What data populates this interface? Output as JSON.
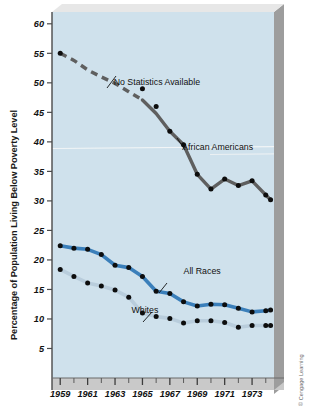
{
  "figure": {
    "credit": "© Cengage Learning",
    "background_color": "#ffffff",
    "plot_background_color": "#cfe1ec",
    "shadow_color": "#9a9a9a",
    "axis_band_color": "#c8c8c8"
  },
  "chart_data": {
    "type": "line",
    "title": "",
    "xlabel": "",
    "ylabel": "Percentage of Population Living Below Poverty Level",
    "xlim": [
      1958.4,
      1974.6
    ],
    "ylim": [
      0,
      62
    ],
    "grid": false,
    "legend_position": "inline-annotations",
    "ytick_labels": [
      "60",
      "55",
      "50",
      "45",
      "40",
      "35",
      "30",
      "25",
      "20",
      "15",
      "10",
      "5"
    ],
    "yticks": [
      60,
      55,
      50,
      45,
      40,
      35,
      30,
      25,
      20,
      15,
      10,
      5
    ],
    "xtick_labels": [
      "1959",
      "1961",
      "1963",
      "1965",
      "1967",
      "1969",
      "1971",
      "1973"
    ],
    "xticks": [
      1959,
      1961,
      1963,
      1965,
      1967,
      1969,
      1971,
      1973
    ],
    "xticks_minor": [
      1960,
      1962,
      1964,
      1966,
      1968,
      1970,
      1972,
      1974
    ],
    "x": [
      1959,
      1960,
      1961,
      1962,
      1963,
      1964,
      1965,
      1966,
      1967,
      1968,
      1969,
      1970,
      1971,
      1972,
      1973,
      1974
    ],
    "annotations": [
      {
        "text": "No Statistics Available",
        "x": 1962.9,
        "y": 49.7
      },
      {
        "text": "African Americans",
        "x": 1967.9,
        "y": 38.6
      },
      {
        "text": "All Races",
        "x": 1968.0,
        "y": 17.6
      },
      {
        "text": "Whites",
        "x": 1964.2,
        "y": 11.0
      }
    ],
    "series": [
      {
        "name": "African Americans",
        "color": "#5f5f5f",
        "marker_color": "#0d0d0d",
        "dashed_range": [
          1959,
          1965
        ],
        "values": [
          55.0,
          null,
          null,
          null,
          null,
          null,
          49.0,
          46.0,
          41.8,
          39.5,
          34.5,
          32.0,
          33.7,
          32.6,
          33.4,
          31.0
        ],
        "values_full": [
          55.0,
          53.8,
          52.2,
          51.0,
          49.9,
          48.5,
          47.1,
          44.8,
          41.8,
          39.5,
          34.5,
          32.0,
          33.7,
          32.6,
          33.4,
          31.0
        ],
        "final_point": {
          "x": 1974.35,
          "y": 30.2
        }
      },
      {
        "name": "All Races",
        "color": "#3b7fba",
        "marker_color": "#0d0d0d",
        "values": [
          22.4,
          22.0,
          21.8,
          20.9,
          19.1,
          18.7,
          17.2,
          14.7,
          14.3,
          12.9,
          12.2,
          12.5,
          12.4,
          11.8,
          11.2,
          11.4
        ],
        "final_point": {
          "x": 1974.35,
          "y": 11.5
        }
      },
      {
        "name": "Whites",
        "color": "#b9cddc",
        "marker_color": "#0d0d0d",
        "values": [
          18.4,
          17.2,
          16.1,
          15.6,
          14.9,
          13.7,
          11.0,
          10.4,
          10.1,
          9.3,
          9.7,
          9.7,
          9.4,
          8.6,
          8.9,
          8.9
        ],
        "final_point": {
          "x": 1974.35,
          "y": 8.9
        }
      }
    ]
  }
}
